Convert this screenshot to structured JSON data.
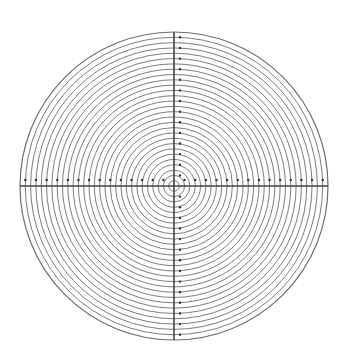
{
  "diagram": {
    "title": "",
    "type": "concentric-circle reticle",
    "center": [
      174,
      186
    ],
    "outer_radius": 154,
    "ring_count": 29,
    "ring_color": "#6e6e6e",
    "axis_color": "#444444",
    "dot_color": "#333333",
    "background": "#ffffff",
    "axes": [
      "horizontal",
      "vertical"
    ],
    "dot_spacing_rings": 2
  }
}
